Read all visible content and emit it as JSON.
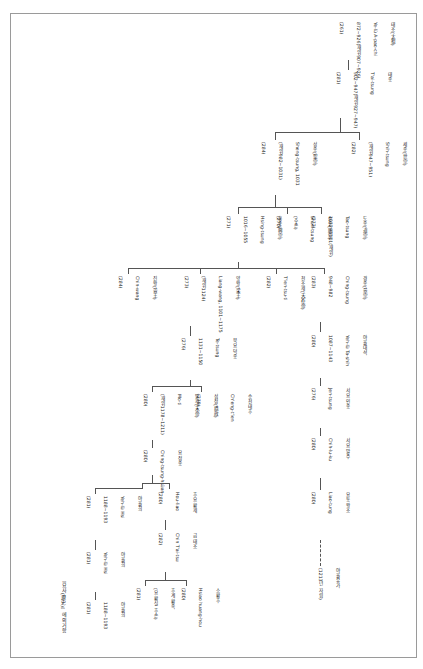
{
  "diagram": {
    "note": "『요사(遼史)』에 의거함",
    "nodes": [
      {
        "id": "n1",
        "lines": [
          "태조(太祖)",
          "Ye-lü A-pao-chi",
          "(耶律阿保機)",
          "872~926(재위907~926)",
          "(261)"
        ]
      },
      {
        "id": "n2",
        "lines": [
          "태종",
          "T'ai-tsung",
          "902~947(재위927~947)",
          "(281)"
        ]
      },
      {
        "id": "n3",
        "lines": [
          "세종(世宗)",
          "Shih-tsung",
          "(재위947~951)",
          "(282)"
        ]
      },
      {
        "id": "n4",
        "lines": [
          "경종(景宗)",
          "Ching-tsung",
          "948~982",
          "(283)"
        ]
      },
      {
        "id": "n5",
        "lines": [
          "성종(聖宗)",
          "Sheng-tsung, 1031",
          "(재위982~1031)",
          "(284)"
        ]
      },
      {
        "id": "n6",
        "lines": [
          "흥종(興宗)",
          "Hsing-tsung",
          "1016~1055",
          "(271)"
        ]
      },
      {
        "id": "n7",
        "lines": [
          "도종(道宗)",
          "Tao-tsung",
          "1032~1101(재위)",
          "(272)"
        ]
      },
      {
        "id": "n8",
        "lines": [
          "순종(順宗)",
          "Shun-tsung",
          "(추존)",
          "(270)"
        ]
      },
      {
        "id": "n9",
        "lines": [
          "천조제(天祚帝)",
          "T'ien-tsu-ti",
          "1075~1128",
          "(282)"
        ]
      },
      {
        "id": "n10",
        "lines": [
          "진왕(晉王)",
          "Chin-wang",
          "(284)"
        ]
      },
      {
        "id": "n11",
        "lines": [
          "양왕(梁王)",
          "Liang-wang, 1101~1175",
          "(재위1124)",
          "(273)"
        ]
      },
      {
        "id": "n12",
        "lines": [
          "북요 덕종",
          "Te-tsung",
          "1131~1150",
          "(276)"
        ]
      },
      {
        "id": "n13",
        "lines": [
          "서요 인종",
          "Jen-tsung",
          "1151~1163(재위)",
          "(276)"
        ]
      },
      {
        "id": "n14",
        "lines": [
          "승천태후",
          "Ch'eng-t'ien",
          "섭정(攝政)",
          "(279)"
        ]
      },
      {
        "id": "n15",
        "lines": [
          "말제(末帝)",
          "Mo-ti",
          "(재위1178~1211)",
          "(280)"
        ]
      },
      {
        "id": "n16",
        "lines": [
          "서요 말주",
          "Chih-lu-ku",
          "1178~1211",
          "(280)"
        ]
      },
      {
        "id": "n17",
        "lines": [
          "요 정종",
          "Ching-tsung-hsüan",
          "(280)"
        ]
      },
      {
        "id": "n18",
        "lines": [
          "야율대석",
          "Yeh-lü Ta-shih",
          "1087~1143",
          "(280)"
        ]
      },
      {
        "id": "n19",
        "lines": [
          "소황후",
          "Hsiao huang-hou",
          "1177~1181",
          "(280)"
        ]
      },
      {
        "id": "n20",
        "lines": [
          "야율희",
          "Yeh-lü Hsi",
          "1188~1193",
          "(281)"
        ]
      },
      {
        "id": "n21",
        "lines": [
          "후요 황제",
          "Hou-liao",
          "(280)"
        ]
      },
      {
        "id": "n22",
        "lines": [
          "요동 왕조",
          "Liao-tung",
          "(280)"
        ]
      },
      {
        "id": "n23",
        "lines": [
          "금 태조",
          "Chin T'ai-tsu",
          "(282)"
        ]
      },
      {
        "id": "n24",
        "lines": [
          "야율유가",
          "Yeh-lü Liu-ko",
          "(1213년 자립)"
        ]
      },
      {
        "id": "n25",
        "lines": [
          "후계 황족",
          "(요 황실 후손)",
          "(281)"
        ]
      }
    ]
  }
}
